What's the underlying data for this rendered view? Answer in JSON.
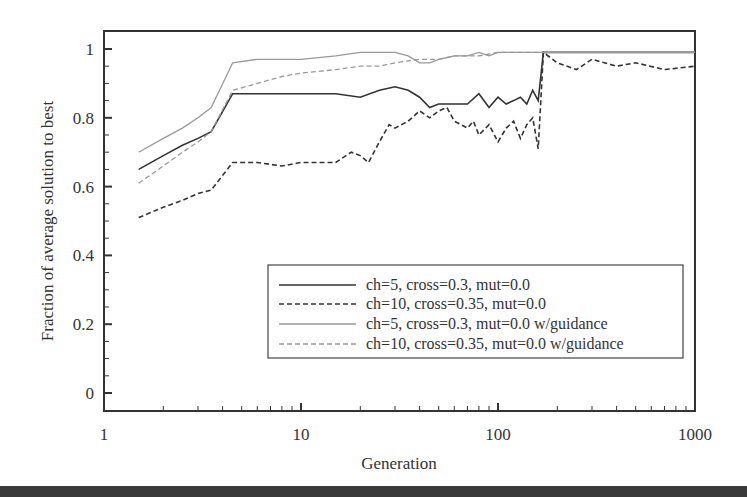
{
  "chart_data": {
    "type": "line",
    "title": "",
    "xlabel": "Generation",
    "ylabel": "Fraction of average solution to best",
    "xscale": "log",
    "xlim": [
      1,
      1000
    ],
    "ylim": [
      0,
      1
    ],
    "xticks": [
      "1",
      "10",
      "100",
      "1000"
    ],
    "yticks": [
      "0",
      "0.2",
      "0.4",
      "0.6",
      "0.8",
      "1"
    ],
    "grid": false,
    "legend_position": "lower right (inside)",
    "series": [
      {
        "name": "ch=5, cross=0.3, mut=0.0",
        "color": "#333333",
        "style": "solid",
        "x": [
          1.5,
          2,
          2.5,
          3,
          3.5,
          4.5,
          6,
          8,
          10,
          15,
          20,
          25,
          30,
          35,
          40,
          45,
          50,
          60,
          70,
          80,
          90,
          100,
          110,
          120,
          130,
          140,
          150,
          160,
          170,
          200,
          300,
          500,
          1000
        ],
        "y": [
          0.65,
          0.69,
          0.72,
          0.74,
          0.76,
          0.87,
          0.87,
          0.87,
          0.87,
          0.87,
          0.86,
          0.88,
          0.89,
          0.88,
          0.86,
          0.83,
          0.84,
          0.84,
          0.84,
          0.87,
          0.83,
          0.86,
          0.84,
          0.85,
          0.86,
          0.84,
          0.88,
          0.85,
          0.99,
          0.99,
          0.99,
          0.99,
          0.99
        ]
      },
      {
        "name": "ch=10, cross=0.35, mut=0.0",
        "color": "#333333",
        "style": "dashed",
        "x": [
          1.5,
          2,
          2.5,
          3,
          3.5,
          4.5,
          6,
          8,
          10,
          12,
          15,
          18,
          20,
          22,
          25,
          28,
          30,
          35,
          40,
          45,
          50,
          55,
          60,
          70,
          75,
          80,
          90,
          100,
          110,
          120,
          130,
          140,
          150,
          160,
          170,
          200,
          250,
          300,
          400,
          500,
          700,
          1000
        ],
        "y": [
          0.51,
          0.54,
          0.56,
          0.58,
          0.59,
          0.67,
          0.67,
          0.66,
          0.67,
          0.67,
          0.67,
          0.7,
          0.69,
          0.67,
          0.73,
          0.78,
          0.77,
          0.79,
          0.82,
          0.8,
          0.82,
          0.83,
          0.79,
          0.77,
          0.79,
          0.75,
          0.78,
          0.73,
          0.77,
          0.79,
          0.74,
          0.78,
          0.8,
          0.71,
          0.99,
          0.96,
          0.94,
          0.97,
          0.95,
          0.96,
          0.94,
          0.95
        ]
      },
      {
        "name": "ch=5, cross=0.3, mut=0.0 w/guidance",
        "color": "#999999",
        "style": "solid",
        "x": [
          1.5,
          2,
          2.5,
          3,
          3.5,
          4.5,
          6,
          8,
          10,
          15,
          20,
          25,
          30,
          35,
          40,
          45,
          50,
          60,
          70,
          80,
          90,
          100,
          120,
          140,
          160,
          170,
          200,
          300,
          500,
          1000
        ],
        "y": [
          0.7,
          0.74,
          0.77,
          0.8,
          0.83,
          0.96,
          0.97,
          0.97,
          0.97,
          0.98,
          0.99,
          0.99,
          0.99,
          0.98,
          0.96,
          0.96,
          0.97,
          0.98,
          0.98,
          0.99,
          0.98,
          0.99,
          0.99,
          0.99,
          0.99,
          0.99,
          0.99,
          0.99,
          0.99,
          0.99
        ]
      },
      {
        "name": "ch=10, cross=0.35, mut=0.0 w/guidance",
        "color": "#999999",
        "style": "dashed",
        "x": [
          1.5,
          2,
          2.5,
          3,
          3.5,
          4.5,
          6,
          8,
          10,
          15,
          20,
          25,
          30,
          40,
          50,
          60,
          70,
          80,
          100,
          120,
          140,
          160,
          170,
          200,
          300,
          500,
          1000
        ],
        "y": [
          0.61,
          0.66,
          0.7,
          0.73,
          0.76,
          0.88,
          0.9,
          0.92,
          0.93,
          0.94,
          0.95,
          0.95,
          0.96,
          0.97,
          0.97,
          0.98,
          0.98,
          0.98,
          0.99,
          0.99,
          0.99,
          0.99,
          0.99,
          0.99,
          0.99,
          0.99,
          0.99
        ]
      }
    ]
  }
}
